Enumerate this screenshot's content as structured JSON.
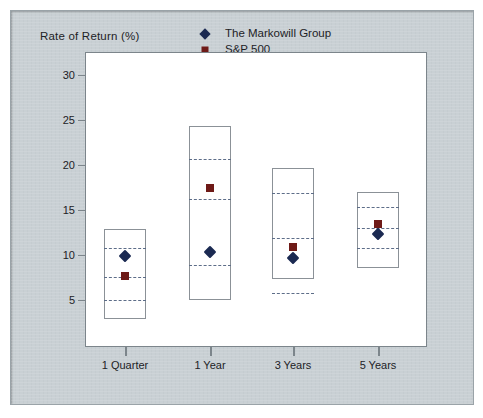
{
  "chart_data": {
    "type": "bar",
    "title": "",
    "ylabel": "Rate of Return (%)",
    "xlabel": "",
    "ylim": [
      2,
      32
    ],
    "yticks": [
      5,
      10,
      15,
      20,
      25,
      30
    ],
    "grid": false,
    "legend_position": "top-right",
    "categories": [
      "1 Quarter",
      "1 Year",
      "3 Years",
      "5 Years"
    ],
    "series": [
      {
        "name": "The Markowill Group",
        "marker": "diamond",
        "color": "#1b2a52",
        "values": [
          9.9,
          10.3,
          9.7,
          12.3
        ]
      },
      {
        "name": "S&P 500",
        "marker": "square",
        "color": "#6e1a17",
        "values": [
          7.7,
          17.4,
          10.9,
          13.4
        ]
      }
    ],
    "boxes": [
      {
        "category": "1 Quarter",
        "top": 12.9,
        "bottom": 2.9,
        "quartiles": [
          10.8,
          7.6,
          5.0
        ]
      },
      {
        "category": "1 Year",
        "top": 24.3,
        "bottom": 5.0,
        "quartiles": [
          20.7,
          16.2,
          8.9
        ]
      },
      {
        "category": "3 Years",
        "top": 19.7,
        "bottom": 7.3,
        "quartiles": [
          16.9,
          11.9,
          5.8
        ]
      },
      {
        "category": "5 Years",
        "top": 17.0,
        "bottom": 8.6,
        "quartiles": [
          15.3,
          13.0,
          10.8
        ]
      }
    ],
    "colors": {
      "diamond": "#1b2a52",
      "square": "#6e1a17",
      "box_outline": "#8b9197",
      "quartile_line": "#5d6d88",
      "background": "#c9d0d4",
      "plot_background": "#ffffff"
    }
  },
  "legend": {
    "items": [
      {
        "label": "The Markowill Group",
        "marker": "diamond-marker-icon"
      },
      {
        "label": "S&P 500",
        "marker": "square-marker-icon"
      }
    ]
  },
  "axis": {
    "y_title": "Rate of Return (%)",
    "y_tick_labels": [
      "30",
      "25",
      "20",
      "15",
      "10",
      "5"
    ],
    "x_tick_labels": [
      "1 Quarter",
      "1 Year",
      "3 Years",
      "5 Years"
    ]
  }
}
